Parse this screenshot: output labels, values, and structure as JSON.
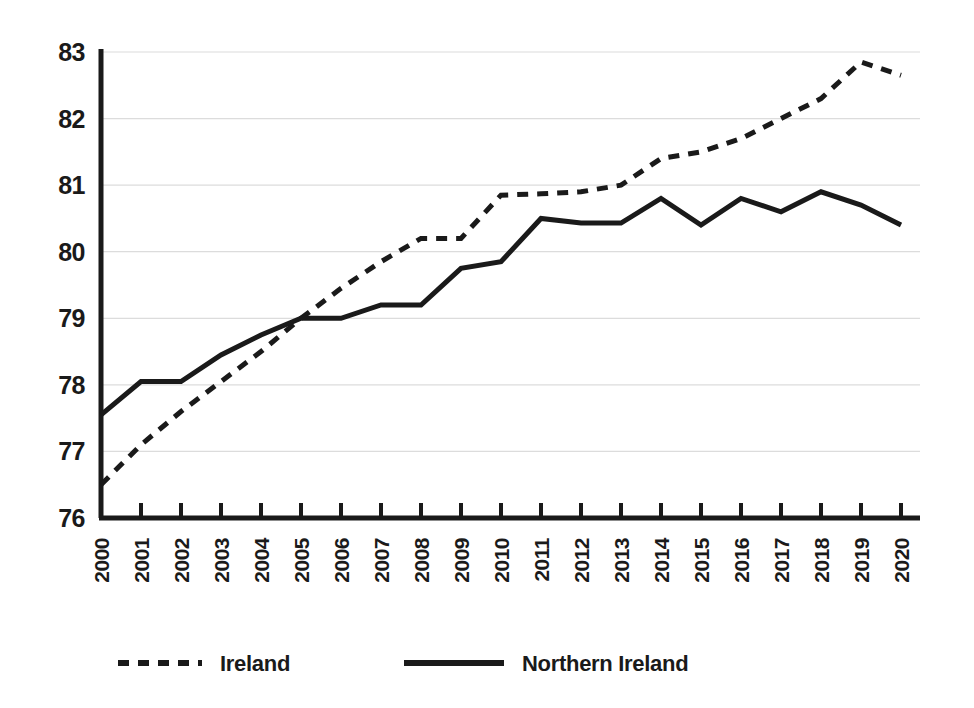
{
  "chart_data": {
    "type": "line",
    "title": "",
    "subtitle": "",
    "xlabel": "",
    "ylabel": "",
    "categories": [
      "2000",
      "2001",
      "2002",
      "2003",
      "2004",
      "2005",
      "2006",
      "2007",
      "2008",
      "2009",
      "2010",
      "2011",
      "2012",
      "2013",
      "2014",
      "2015",
      "2016",
      "2017",
      "2018",
      "2019",
      "2020"
    ],
    "x": [
      2000,
      2001,
      2002,
      2003,
      2004,
      2005,
      2006,
      2007,
      2008,
      2009,
      2010,
      2011,
      2012,
      2013,
      2014,
      2015,
      2016,
      2017,
      2018,
      2019,
      2020
    ],
    "series": [
      {
        "name": "Ireland",
        "style": "dashed",
        "color": "#1a1a1a",
        "values": [
          76.5,
          77.1,
          77.6,
          78.05,
          78.5,
          79.0,
          79.45,
          79.85,
          80.2,
          80.2,
          80.85,
          80.87,
          80.9,
          81.0,
          81.4,
          81.5,
          81.7,
          82.0,
          82.3,
          82.85,
          82.65
        ]
      },
      {
        "name": "Northern Ireland",
        "style": "solid",
        "color": "#1a1a1a",
        "values": [
          77.55,
          78.05,
          78.05,
          78.45,
          78.75,
          79.0,
          79.0,
          79.2,
          79.2,
          79.75,
          79.85,
          80.5,
          80.43,
          80.43,
          80.8,
          80.4,
          80.8,
          80.6,
          80.9,
          80.7,
          80.4
        ]
      }
    ],
    "ylim": [
      76,
      83
    ],
    "yticks": [
      76,
      77,
      78,
      79,
      80,
      81,
      82,
      83
    ],
    "ytick_labels": [
      "76",
      "77",
      "78",
      "79",
      "80",
      "81",
      "82",
      "83"
    ],
    "xtick_labels": [
      "2000",
      "2001",
      "2002",
      "2003",
      "2004",
      "2005",
      "2006",
      "2007",
      "2008",
      "2009",
      "2010",
      "2011",
      "2012",
      "2013",
      "2014",
      "2015",
      "2016",
      "2017",
      "2018",
      "2019",
      "2020"
    ],
    "grid": true,
    "grid_axis": "y",
    "grid_color": "#dcdcdc",
    "axis_color": "#1a1a1a",
    "background": "#ffffff",
    "legend_position": "bottom-left",
    "legend": [
      {
        "label": "Ireland",
        "style": "dashed"
      },
      {
        "label": "Northern Ireland",
        "style": "solid"
      }
    ]
  }
}
